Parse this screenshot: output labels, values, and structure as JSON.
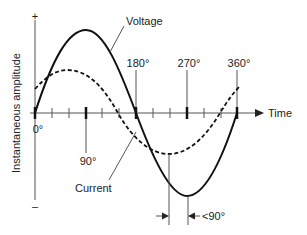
{
  "diagram": {
    "y_axis": {
      "label": "Instantaneous amplitude",
      "positive_sign": "+",
      "negative_sign": "–"
    },
    "x_axis": {
      "label": "Time",
      "ticks": [
        {
          "label": "0°",
          "deg": 0
        },
        {
          "label": "90°",
          "deg": 90
        },
        {
          "label": "180°",
          "deg": 180
        },
        {
          "label": "270°",
          "deg": 270
        },
        {
          "label": "360°",
          "deg": 360
        }
      ]
    },
    "curves": [
      {
        "name": "Voltage",
        "style": "solid",
        "amplitude": 1.0,
        "phase_deg": 0
      },
      {
        "name": "Current",
        "style": "dashed",
        "amplitude": 0.55,
        "phase_deg": -45
      }
    ],
    "annotation": {
      "phase_label": "<90°"
    },
    "colors": {
      "line": "#111111",
      "axis": "#555555",
      "text": "#222222",
      "background": "#ffffff"
    }
  }
}
